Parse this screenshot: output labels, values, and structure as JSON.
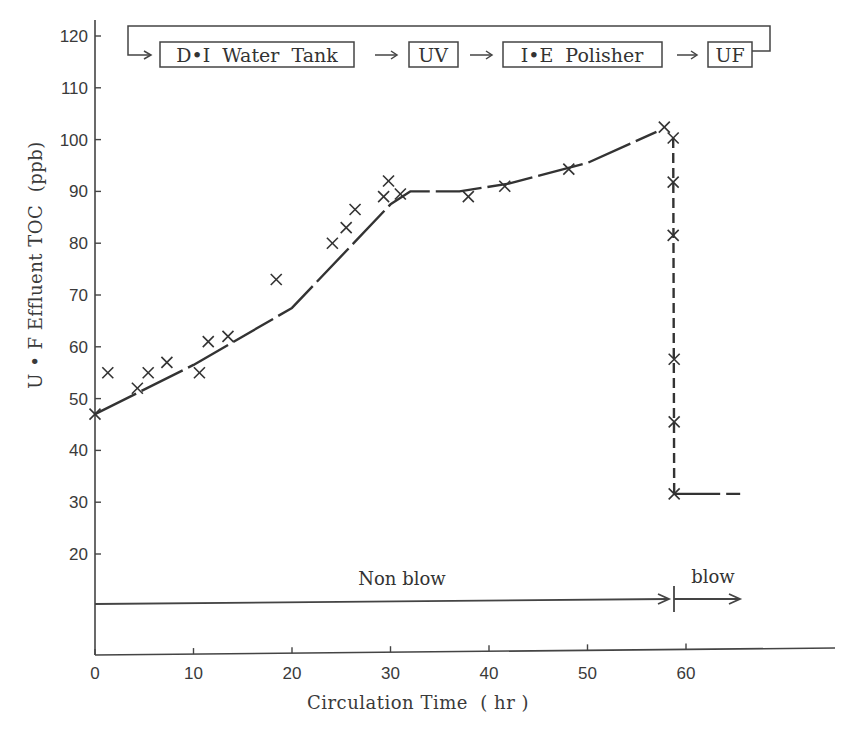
{
  "chart_data": {
    "type": "line",
    "title": "",
    "xlabel": "Circulation Time (hr)",
    "ylabel": "U • F Effluent TOC (ppb)",
    "xlim": [
      0,
      70
    ],
    "ylim": [
      10,
      120
    ],
    "x_ticks": [
      0,
      10,
      20,
      30,
      40,
      50,
      60
    ],
    "y_ticks": [
      20,
      30,
      40,
      50,
      60,
      70,
      80,
      90,
      100,
      110,
      120
    ],
    "grid": false,
    "legend": null,
    "series": [
      {
        "name": "UF effluent TOC (measured)",
        "marker": "x",
        "points": [
          {
            "x": 0.0,
            "y": 47.0
          },
          {
            "x": 1.3,
            "y": 55.0
          },
          {
            "x": 4.3,
            "y": 52.0
          },
          {
            "x": 5.4,
            "y": 55.0
          },
          {
            "x": 7.3,
            "y": 57.0
          },
          {
            "x": 10.6,
            "y": 55.0
          },
          {
            "x": 11.5,
            "y": 61.0
          },
          {
            "x": 13.5,
            "y": 62.0
          },
          {
            "x": 18.4,
            "y": 73.0
          },
          {
            "x": 24.1,
            "y": 80.0
          },
          {
            "x": 25.5,
            "y": 83.0
          },
          {
            "x": 26.4,
            "y": 86.5
          },
          {
            "x": 29.3,
            "y": 89.0
          },
          {
            "x": 29.8,
            "y": 92.0
          },
          {
            "x": 31.0,
            "y": 89.5
          },
          {
            "x": 37.9,
            "y": 89.0
          },
          {
            "x": 41.6,
            "y": 91.0
          },
          {
            "x": 48.1,
            "y": 94.3
          },
          {
            "x": 57.8,
            "y": 102.4
          },
          {
            "x": 58.7,
            "y": 100.3
          },
          {
            "x": 58.7,
            "y": 91.8
          },
          {
            "x": 58.7,
            "y": 81.5
          },
          {
            "x": 58.8,
            "y": 57.6
          },
          {
            "x": 58.8,
            "y": 45.5
          },
          {
            "x": 58.8,
            "y": 31.6
          }
        ]
      },
      {
        "name": "Trend (non blow)",
        "style": "solid",
        "points": [
          {
            "x": 0.0,
            "y": 47.0
          },
          {
            "x": 10.0,
            "y": 56.5
          },
          {
            "x": 20.0,
            "y": 67.5
          },
          {
            "x": 30.0,
            "y": 87.5
          },
          {
            "x": 32.0,
            "y": 90.0
          },
          {
            "x": 37.0,
            "y": 90.0
          },
          {
            "x": 42.0,
            "y": 91.5
          },
          {
            "x": 50.0,
            "y": 95.5
          },
          {
            "x": 57.0,
            "y": 101.5
          }
        ]
      },
      {
        "name": "Trend (blow drop)",
        "style": "dashed",
        "points": [
          {
            "x": 58.7,
            "y": 100.3
          },
          {
            "x": 58.8,
            "y": 31.6
          }
        ]
      },
      {
        "name": "Trend (blow steady)",
        "style": "solid",
        "points": [
          {
            "x": 58.8,
            "y": 31.6
          },
          {
            "x": 65.5,
            "y": 31.6
          }
        ]
      }
    ],
    "annotations": {
      "phases": [
        {
          "label": "Non blow",
          "x_start": 0,
          "x_end": 58.5
        },
        {
          "label": "blow",
          "x_start": 58.5,
          "x_end": 65.5
        }
      ],
      "flow_diagram": [
        "D•I  Water  Tank",
        "UV",
        "I•E  Polisher",
        "UF"
      ]
    }
  },
  "flow": {
    "tank": "D•I  Water  Tank",
    "uv": "UV",
    "polisher": "I•E  Polisher",
    "uf": "UF"
  },
  "phases": {
    "non_blow": "Non blow",
    "blow": "blow"
  },
  "axes": {
    "xlabel": "Circulation Time  ( hr )",
    "ylabel": "U • F  Effluent  TOC  (ppb)"
  }
}
